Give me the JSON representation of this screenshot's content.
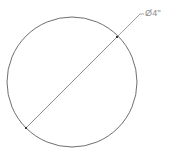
{
  "drawing": {
    "type": "circle-with-diameter-dimension",
    "circle": {
      "cx": 72,
      "cy": 82,
      "r": 65
    },
    "diameter_line": {
      "x1": 26,
      "y1": 128,
      "x2": 117,
      "y2": 37
    },
    "leader": {
      "x1": 117,
      "y1": 37,
      "x2": 140,
      "y2": 14,
      "shelf_x2": 144
    },
    "dimension_label": "Ø4\"",
    "line_color": "#6f6f6f",
    "label_color": "#8a8a8a"
  }
}
